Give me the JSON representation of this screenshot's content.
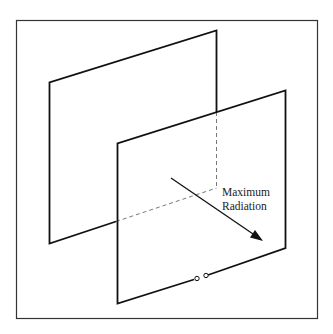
{
  "diagram": {
    "type": "antenna-radiation-schematic",
    "labels": {
      "line1": "Maximum",
      "line2": "Radiation"
    },
    "colors": {
      "stroke": "#111111",
      "frame": "#333333",
      "background": "#ffffff"
    }
  }
}
